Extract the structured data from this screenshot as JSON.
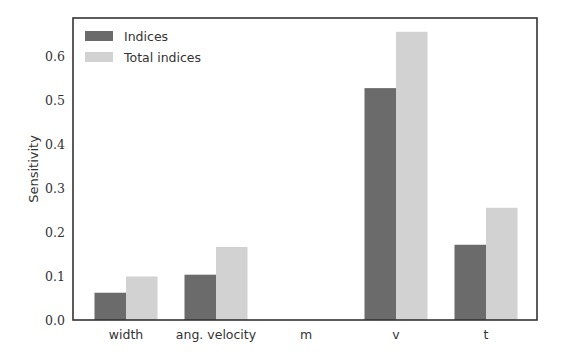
{
  "chart_data": {
    "type": "bar",
    "title": "",
    "xlabel": "",
    "ylabel": "Sensitivity",
    "categories": [
      "width",
      "ang. velocity",
      "m",
      "v",
      "t"
    ],
    "series": [
      {
        "name": "Indices",
        "color": "#6b6b6b",
        "values": [
          0.062,
          0.103,
          0.0,
          0.527,
          0.171
        ]
      },
      {
        "name": "Total indices",
        "color": "#d2d2d2",
        "values": [
          0.099,
          0.166,
          0.0,
          0.655,
          0.255
        ]
      }
    ],
    "ylim": [
      0.0,
      0.68
    ],
    "yticks": [
      "0.0",
      "0.1",
      "0.2",
      "0.3",
      "0.4",
      "0.5",
      "0.6"
    ],
    "grid": false,
    "legend_position": "upper left"
  }
}
